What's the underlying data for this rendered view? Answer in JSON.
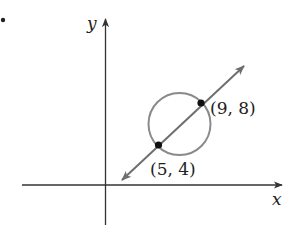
{
  "figure": {
    "bullet": "•",
    "axes": {
      "x_label": "x",
      "y_label": "y",
      "axis_color": "#333333"
    },
    "circle": {
      "stroke_color": "#8a8a8a"
    },
    "line": {
      "stroke_color": "#6e6e6e"
    },
    "points": [
      {
        "label": "(5, 4)",
        "x": 5,
        "y": 4
      },
      {
        "label": "(9, 8)",
        "x": 9,
        "y": 8
      }
    ]
  }
}
